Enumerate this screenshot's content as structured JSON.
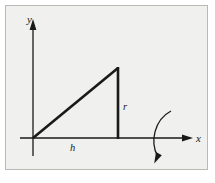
{
  "figure": {
    "panel": {
      "background_color": "#f0f0ee",
      "border_color": "#b9b9b6",
      "page_background_color": "#ffffff",
      "x": 5,
      "y": 5,
      "width": 203,
      "height": 165
    },
    "stroke_color": "#1a1a1a",
    "axes": {
      "y_axis": {
        "label": "y",
        "label_x": 27,
        "label_y": 23,
        "line_x": 33,
        "line_top": 24,
        "line_bottom": 156,
        "arrow_tip_y": 20
      },
      "x_axis": {
        "label": "x",
        "label_x": 196,
        "label_y": 142,
        "line_y": 138,
        "line_left": 20,
        "line_right": 188,
        "arrow_tip_x": 193
      }
    },
    "triangle": {
      "description": "right triangle with base on x-axis and vertical leg at right",
      "origin_vertex": {
        "x": 33,
        "y": 138
      },
      "base_vertex": {
        "x": 118,
        "y": 138
      },
      "apex_vertex": {
        "x": 118,
        "y": 68
      },
      "line_width": 2.6
    },
    "dimension_labels": {
      "base": {
        "text": "h",
        "x": 70,
        "y": 151
      },
      "height": {
        "text": "r",
        "x": 123,
        "y": 110
      }
    },
    "rotation_arrow": {
      "description": "curved arc indicating rotation about the x-axis",
      "start_x": 171,
      "start_y": 111,
      "control_x": 150,
      "control_y": 136,
      "end_x": 158,
      "end_y": 157,
      "arrow_tip_x": 155,
      "arrow_tip_y": 163
    }
  }
}
